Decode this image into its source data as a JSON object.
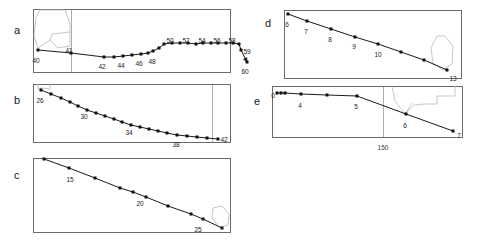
{
  "figure": {
    "width": 483,
    "height": 243,
    "background": "#ffffff",
    "line_color": "#1a1a1a",
    "marker_color": "#111111",
    "frame_color": "#6b6b6b",
    "overlay_color": "#b9b9b9",
    "gridline_color": "#8a8a8a",
    "label_color": "#222222"
  },
  "chart_data": [
    {
      "id": "a",
      "type": "line",
      "title": "a",
      "xlabel": "",
      "ylabel": "",
      "grid": false,
      "legend": null,
      "xlim": [
        0,
        193
      ],
      "ylim": [
        0,
        63
      ],
      "frame": {
        "x": 33,
        "y": 9,
        "w": 197,
        "h": 63
      },
      "letter": {
        "text": "a",
        "x": 14,
        "y": 25
      },
      "vlines": [
        71
      ],
      "points": [
        {
          "x": 38,
          "y": 50,
          "label": "40"
        },
        {
          "x": 71,
          "y": 53,
          "label": "41"
        },
        {
          "x": 104,
          "y": 57,
          "label": "42"
        },
        {
          "x": 114,
          "y": 57,
          "label": null
        },
        {
          "x": 123,
          "y": 56,
          "label": "44"
        },
        {
          "x": 132,
          "y": 55,
          "label": null
        },
        {
          "x": 141,
          "y": 54,
          "label": "46"
        },
        {
          "x": 148,
          "y": 53,
          "label": null
        },
        {
          "x": 153,
          "y": 51,
          "label": "48"
        },
        {
          "x": 159,
          "y": 48,
          "label": null
        },
        {
          "x": 164,
          "y": 44,
          "label": null
        },
        {
          "x": 172,
          "y": 43,
          "label": "50"
        },
        {
          "x": 180,
          "y": 43,
          "label": null
        },
        {
          "x": 188,
          "y": 43,
          "label": "52"
        },
        {
          "x": 196,
          "y": 44,
          "label": null
        },
        {
          "x": 203,
          "y": 43,
          "label": "54"
        },
        {
          "x": 211,
          "y": 43,
          "label": null
        },
        {
          "x": 218,
          "y": 43,
          "label": "56"
        },
        {
          "x": 226,
          "y": 43,
          "label": null
        },
        {
          "x": 233,
          "y": 43,
          "label": "58"
        },
        {
          "x": 239,
          "y": 44,
          "label": null
        },
        {
          "x": 241,
          "y": 50,
          "label": "59"
        },
        {
          "x": 247,
          "y": 62,
          "label": "60"
        }
      ],
      "point_labels": [
        {
          "text": "40",
          "x": 36,
          "y": 57
        },
        {
          "text": "41",
          "x": 69,
          "y": 47
        },
        {
          "text": "42",
          "x": 102,
          "y": 63
        },
        {
          "text": "44",
          "x": 121,
          "y": 62
        },
        {
          "text": "46",
          "x": 139,
          "y": 60
        },
        {
          "text": "48",
          "x": 152,
          "y": 58
        },
        {
          "text": "50",
          "x": 170,
          "y": 37
        },
        {
          "text": "52",
          "x": 186,
          "y": 37
        },
        {
          "text": "54",
          "x": 202,
          "y": 37
        },
        {
          "text": "56",
          "x": 217,
          "y": 37
        },
        {
          "text": "58",
          "x": 232,
          "y": 37
        },
        {
          "text": "59",
          "x": 247,
          "y": 48
        },
        {
          "text": "60",
          "x": 245,
          "y": 68
        }
      ],
      "axis_ticks": [],
      "overlay": "M 40 10 L 36 17 L 34 36 L 38 48 L 50 40 L 52 34 L 70 32 L 70 24 L 65 10 L 40 10 M 50 40 L 58 48 L 70 46 L 70 32"
    },
    {
      "id": "b",
      "type": "line",
      "title": "b",
      "xlabel": "",
      "ylabel": "",
      "grid": false,
      "legend": null,
      "xlim": [
        0,
        193
      ],
      "ylim": [
        0,
        58
      ],
      "frame": {
        "x": 33,
        "y": 84,
        "w": 197,
        "h": 58
      },
      "letter": {
        "text": "b",
        "x": 14,
        "y": 95
      },
      "vlines": [
        212
      ],
      "points": [
        {
          "x": 41,
          "y": 90,
          "label": "26"
        },
        {
          "x": 51,
          "y": 94,
          "label": null
        },
        {
          "x": 61,
          "y": 98,
          "label": null
        },
        {
          "x": 70,
          "y": 102,
          "label": null
        },
        {
          "x": 78,
          "y": 106,
          "label": "30"
        },
        {
          "x": 87,
          "y": 110,
          "label": null
        },
        {
          "x": 96,
          "y": 113,
          "label": null
        },
        {
          "x": 105,
          "y": 116,
          "label": null
        },
        {
          "x": 114,
          "y": 119,
          "label": null
        },
        {
          "x": 122,
          "y": 122,
          "label": "34"
        },
        {
          "x": 131,
          "y": 125,
          "label": null
        },
        {
          "x": 140,
          "y": 127,
          "label": null
        },
        {
          "x": 149,
          "y": 129,
          "label": null
        },
        {
          "x": 158,
          "y": 131,
          "label": null
        },
        {
          "x": 167,
          "y": 133,
          "label": null
        },
        {
          "x": 177,
          "y": 135,
          "label": "38"
        },
        {
          "x": 187,
          "y": 136,
          "label": null
        },
        {
          "x": 197,
          "y": 137,
          "label": null
        },
        {
          "x": 207,
          "y": 138,
          "label": null
        },
        {
          "x": 218,
          "y": 139,
          "label": "42"
        }
      ],
      "point_labels": [
        {
          "text": "26",
          "x": 40,
          "y": 97
        },
        {
          "text": "30",
          "x": 84,
          "y": 113
        },
        {
          "text": "34",
          "x": 129,
          "y": 129
        },
        {
          "text": "38",
          "x": 176,
          "y": 141
        },
        {
          "text": "42",
          "x": 224,
          "y": 136
        }
      ],
      "axis_ticks": [],
      "overlay": "M 38 84 L 38 89 L 42 88 L 50 89 L 50 84"
    },
    {
      "id": "c",
      "type": "line",
      "title": "c",
      "xlabel": "",
      "ylabel": "",
      "grid": false,
      "legend": null,
      "xlim": [
        0,
        193
      ],
      "ylim": [
        0,
        74
      ],
      "frame": {
        "x": 33,
        "y": 158,
        "w": 197,
        "h": 74
      },
      "letter": {
        "text": "c",
        "x": 14,
        "y": 170
      },
      "vlines": [],
      "points": [
        {
          "x": 44,
          "y": 159,
          "label": null
        },
        {
          "x": 69,
          "y": 168,
          "label": "15"
        },
        {
          "x": 95,
          "y": 178,
          "label": null
        },
        {
          "x": 120,
          "y": 188,
          "label": null
        },
        {
          "x": 133,
          "y": 192,
          "label": null
        },
        {
          "x": 146,
          "y": 197,
          "label": "20"
        },
        {
          "x": 168,
          "y": 206,
          "label": null
        },
        {
          "x": 191,
          "y": 214,
          "label": null
        },
        {
          "x": 203,
          "y": 219,
          "label": "25"
        },
        {
          "x": 222,
          "y": 228,
          "label": null
        }
      ],
      "point_labels": [
        {
          "text": "15",
          "x": 70,
          "y": 176
        },
        {
          "text": "20",
          "x": 140,
          "y": 200
        },
        {
          "text": "25",
          "x": 198,
          "y": 226
        }
      ],
      "axis_ticks": [],
      "overlay": "M 213 208 L 212 218 L 219 227 L 228 225 L 229 214 L 222 206 L 213 208 M 229 219 L 230 219"
    },
    {
      "id": "d",
      "type": "line",
      "title": "d",
      "xlabel": "",
      "ylabel": "",
      "grid": false,
      "legend": null,
      "xlim": [
        0,
        175
      ],
      "ylim": [
        0,
        66
      ],
      "frame": {
        "x": 284,
        "y": 10,
        "w": 177,
        "h": 68
      },
      "letter": {
        "text": "d",
        "x": 265,
        "y": 18
      },
      "vlines": [],
      "points": [
        {
          "x": 288,
          "y": 14,
          "label": "6"
        },
        {
          "x": 307,
          "y": 21,
          "label": "7"
        },
        {
          "x": 331,
          "y": 29,
          "label": "8"
        },
        {
          "x": 355,
          "y": 37,
          "label": "9"
        },
        {
          "x": 378,
          "y": 44,
          "label": "10"
        },
        {
          "x": 401,
          "y": 52,
          "label": null
        },
        {
          "x": 424,
          "y": 60,
          "label": null
        },
        {
          "x": 447,
          "y": 70,
          "label": "13"
        }
      ],
      "point_labels": [
        {
          "text": "6",
          "x": 287,
          "y": 21
        },
        {
          "text": "7",
          "x": 306,
          "y": 28
        },
        {
          "text": "8",
          "x": 330,
          "y": 36
        },
        {
          "text": "9",
          "x": 354,
          "y": 43
        },
        {
          "text": "10",
          "x": 378,
          "y": 51
        },
        {
          "text": "13",
          "x": 453,
          "y": 75
        }
      ],
      "axis_ticks": [],
      "overlay": "M 437 36 L 431 48 L 433 63 L 443 70 L 452 64 L 453 46 L 445 36 L 437 36"
    },
    {
      "id": "e",
      "type": "line",
      "title": "e",
      "xlabel": "",
      "ylabel": "",
      "grid": false,
      "legend": null,
      "xlim": [
        0,
        190
      ],
      "ylim": [
        0,
        55
      ],
      "frame": {
        "x": 272,
        "y": 86,
        "w": 190,
        "h": 51
      },
      "letter": {
        "text": "e",
        "x": 254,
        "y": 96
      },
      "vlines": [
        383
      ],
      "points": [
        {
          "x": 277,
          "y": 93,
          "label": "0"
        },
        {
          "x": 281,
          "y": 93,
          "label": null
        },
        {
          "x": 285,
          "y": 93,
          "label": null
        },
        {
          "x": 301,
          "y": 94,
          "label": "4"
        },
        {
          "x": 327,
          "y": 95,
          "label": null
        },
        {
          "x": 357,
          "y": 96,
          "label": "5"
        },
        {
          "x": 406,
          "y": 114,
          "label": "6"
        },
        {
          "x": 453,
          "y": 131,
          "label": "7"
        }
      ],
      "point_labels": [
        {
          "text": "0",
          "x": 273,
          "y": 92
        },
        {
          "text": "4",
          "x": 300,
          "y": 102
        },
        {
          "text": "5",
          "x": 356,
          "y": 103
        },
        {
          "text": "6",
          "x": 405,
          "y": 122
        },
        {
          "text": "7",
          "x": 459,
          "y": 132
        }
      ],
      "axis_ticks": [
        {
          "text": "150",
          "x": 383,
          "y": 144
        }
      ],
      "overlay": "M 392 86 L 395 101 L 405 114 L 414 105 L 425 104 L 437 104 L 437 96 L 455 96 L 455 86 M 405 114 L 412 103"
    }
  ]
}
